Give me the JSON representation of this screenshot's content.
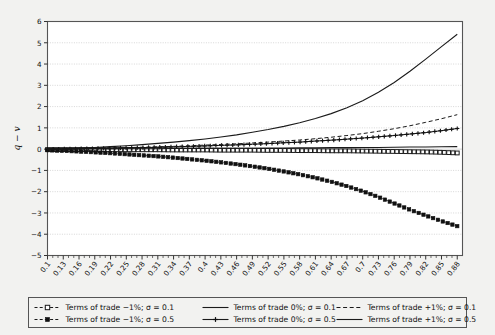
{
  "chart_data": {
    "type": "line",
    "title": "",
    "xlabel": "",
    "ylabel": "q − v",
    "xlim": [
      0.1,
      0.89
    ],
    "ylim": [
      -5,
      6
    ],
    "grid": true,
    "legend_position": "bottom",
    "x_tick_labels": [
      "0.1",
      "0.13",
      "0.16",
      "0.19",
      "0.22",
      "0.25",
      "0.28",
      "0.31",
      "0.34",
      "0.37",
      "0.4",
      "0.43",
      "0.46",
      "0.49",
      "0.52",
      "0.55",
      "0.58",
      "0.61",
      "0.64",
      "0.67",
      "0.7",
      "0.73",
      "0.76",
      "0.79",
      "0.82",
      "0.85",
      "0.88"
    ],
    "y_tick_labels": [
      "6",
      "5",
      "4",
      "3",
      "2",
      "1",
      "0",
      "-1",
      "-2",
      "-3",
      "-4",
      "-5"
    ],
    "y_ticks": [
      6,
      5,
      4,
      3,
      2,
      1,
      0,
      -1,
      -2,
      -3,
      -4,
      -5
    ],
    "x": [
      0.1,
      0.13,
      0.16,
      0.19,
      0.22,
      0.25,
      0.28,
      0.31,
      0.34,
      0.37,
      0.4,
      0.43,
      0.46,
      0.49,
      0.52,
      0.55,
      0.58,
      0.61,
      0.64,
      0.67,
      0.7,
      0.73,
      0.76,
      0.79,
      0.82,
      0.85,
      0.88
    ],
    "series": [
      {
        "name": "Terms of trade −1%; σ = 0.1",
        "style": "dashed-open-square",
        "marker": "open-square",
        "color": "#1a1a1a",
        "values": [
          -0.02,
          -0.02,
          -0.02,
          -0.02,
          -0.03,
          -0.03,
          -0.03,
          -0.03,
          -0.04,
          -0.04,
          -0.04,
          -0.05,
          -0.05,
          -0.05,
          -0.06,
          -0.06,
          -0.07,
          -0.07,
          -0.08,
          -0.08,
          -0.09,
          -0.1,
          -0.11,
          -0.12,
          -0.13,
          -0.15,
          -0.18
        ]
      },
      {
        "name": "Terms of trade −1%; σ = 0.5",
        "style": "dashed-filled-square",
        "marker": "filled-square",
        "color": "#111111",
        "values": [
          -0.05,
          -0.08,
          -0.11,
          -0.15,
          -0.19,
          -0.24,
          -0.29,
          -0.34,
          -0.4,
          -0.47,
          -0.54,
          -0.62,
          -0.71,
          -0.81,
          -0.92,
          -1.05,
          -1.19,
          -1.35,
          -1.53,
          -1.74,
          -1.98,
          -2.25,
          -2.55,
          -2.85,
          -3.12,
          -3.38,
          -3.62
        ]
      },
      {
        "name": "Terms of trade 0%; σ = 0.1",
        "style": "solid-thin",
        "marker": "none",
        "color": "#1a1a1a",
        "values": [
          0.0,
          0.02,
          0.05,
          0.08,
          0.12,
          0.16,
          0.21,
          0.27,
          0.33,
          0.4,
          0.48,
          0.57,
          0.67,
          0.79,
          0.92,
          1.07,
          1.24,
          1.44,
          1.67,
          1.95,
          2.28,
          2.67,
          3.13,
          3.66,
          4.23,
          4.82,
          5.4
        ]
      },
      {
        "name": "Terms of trade 0%; σ = 0.5",
        "style": "solid-plus",
        "marker": "plus",
        "color": "#111111",
        "values": [
          0.0,
          0.01,
          0.02,
          0.03,
          0.04,
          0.06,
          0.07,
          0.09,
          0.11,
          0.13,
          0.15,
          0.18,
          0.2,
          0.23,
          0.26,
          0.3,
          0.33,
          0.38,
          0.42,
          0.47,
          0.52,
          0.58,
          0.64,
          0.71,
          0.78,
          0.87,
          0.97
        ]
      },
      {
        "name": "Terms of trade +1%; σ = 0.1",
        "style": "dashed",
        "marker": "none",
        "color": "#1a1a1a",
        "values": [
          0.0,
          0.01,
          0.02,
          0.04,
          0.05,
          0.07,
          0.09,
          0.11,
          0.13,
          0.16,
          0.19,
          0.22,
          0.25,
          0.29,
          0.33,
          0.38,
          0.43,
          0.49,
          0.56,
          0.64,
          0.73,
          0.84,
          0.96,
          1.1,
          1.26,
          1.43,
          1.62
        ]
      },
      {
        "name": "Terms of trade +1%; σ = 0.5",
        "style": "solid",
        "marker": "none",
        "color": "#1a1a1a",
        "values": [
          0.0,
          0.0,
          0.01,
          0.01,
          0.01,
          0.02,
          0.02,
          0.02,
          0.03,
          0.03,
          0.03,
          0.04,
          0.04,
          0.04,
          0.05,
          0.05,
          0.06,
          0.06,
          0.07,
          0.07,
          0.08,
          0.08,
          0.09,
          0.1,
          0.1,
          0.11,
          0.12
        ]
      }
    ],
    "legend": [
      {
        "label": "Terms of trade −1%; σ = 0.1",
        "marker": "open-square",
        "style": "dashed-open-square"
      },
      {
        "label": "Terms of trade −1%; σ = 0.5",
        "marker": "filled-square",
        "style": "dashed-filled-square"
      },
      {
        "label": "Terms of trade 0%; σ = 0.1",
        "marker": "none",
        "style": "solid-thin"
      },
      {
        "label": "Terms of trade 0%; σ = 0.5",
        "marker": "plus",
        "style": "solid-plus"
      },
      {
        "label": "Terms of trade +1%; σ = 0.1",
        "marker": "none",
        "style": "dashed"
      },
      {
        "label": "Terms of trade +1%; σ = 0.5",
        "marker": "none",
        "style": "solid"
      }
    ],
    "colors": {
      "background": "#f2f2f0",
      "plot_background": "#ffffff",
      "axis": "#555555",
      "grid": "#bcbcbc",
      "line": "#1a1a1a"
    }
  }
}
